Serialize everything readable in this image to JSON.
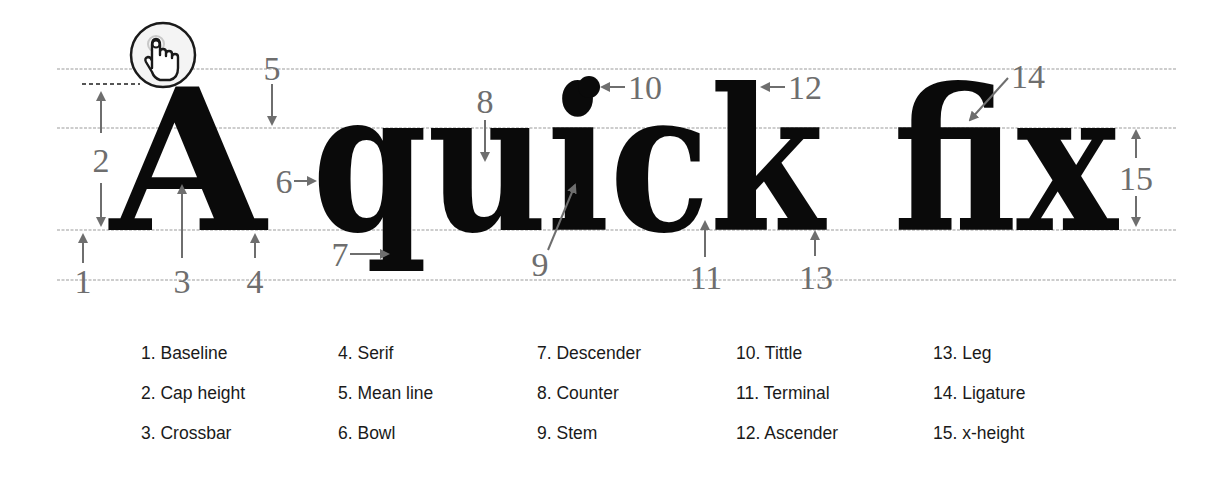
{
  "diagram": {
    "title_text": "A quick fix",
    "words": {
      "cap_a": "A",
      "quick": "quick",
      "fix": "fix"
    },
    "guide_lines": [
      "ascender-line",
      "mean-line",
      "baseline",
      "descender-line"
    ],
    "colors": {
      "glyph": "#0a0a0a",
      "annotation": "#6e6e6e",
      "guide": "#bdbdbd",
      "legend_text": "#1a1a1a"
    },
    "cursor_icon": "pointer-hand-click-icon",
    "annotations": [
      {
        "num": "1",
        "term": "Baseline"
      },
      {
        "num": "2",
        "term": "Cap height"
      },
      {
        "num": "3",
        "term": "Crossbar"
      },
      {
        "num": "4",
        "term": "Serif"
      },
      {
        "num": "5",
        "term": "Mean line"
      },
      {
        "num": "6",
        "term": "Bowl"
      },
      {
        "num": "7",
        "term": "Descender"
      },
      {
        "num": "8",
        "term": "Counter"
      },
      {
        "num": "9",
        "term": "Stem"
      },
      {
        "num": "10",
        "term": "Tittle"
      },
      {
        "num": "11",
        "term": "Terminal"
      },
      {
        "num": "12",
        "term": "Ascender"
      },
      {
        "num": "13",
        "term": "Leg"
      },
      {
        "num": "14",
        "term": "Ligature"
      },
      {
        "num": "15",
        "term": "x-height"
      }
    ]
  },
  "legend": {
    "columns": [
      [
        "1. Baseline",
        "2. Cap height",
        "3. Crossbar"
      ],
      [
        "4. Serif",
        "5. Mean line",
        "6. Bowl"
      ],
      [
        "7. Descender",
        "8. Counter",
        "9. Stem"
      ],
      [
        "10. Tittle",
        "11. Terminal",
        "12. Ascender"
      ],
      [
        "13. Leg",
        "14. Ligature",
        "15. x-height"
      ]
    ]
  }
}
